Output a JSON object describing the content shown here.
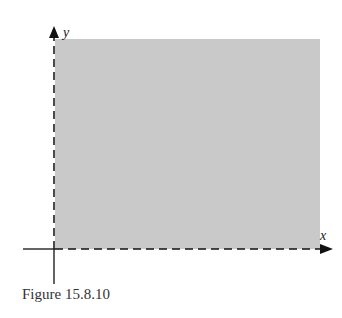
{
  "figure": {
    "caption": "Figure 15.8.10",
    "x_axis_label": "x",
    "y_axis_label": "y",
    "region": {
      "description": "shaded first-quadrant region bounded by dashed axes",
      "fill": "#c8c8c8"
    },
    "axis_color": "#111111",
    "axes_dashed_boundary": true
  }
}
